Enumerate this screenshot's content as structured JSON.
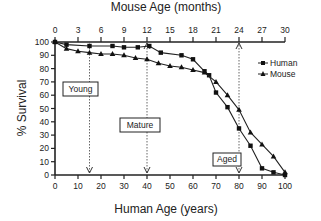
{
  "chart_data": {
    "type": "line",
    "title": "",
    "xlabel": "Human Age (years)",
    "x2label": "Mouse Age (months)",
    "ylabel": "% Survival",
    "xlim": [
      0,
      100
    ],
    "x2lim": [
      0,
      30
    ],
    "ylim": [
      0,
      100
    ],
    "x_ticks": [
      0,
      10,
      20,
      30,
      40,
      50,
      60,
      70,
      80,
      90,
      100
    ],
    "x2_ticks": [
      0,
      3,
      6,
      9,
      12,
      15,
      18,
      21,
      24,
      27,
      30
    ],
    "y_ticks": [
      0,
      10,
      20,
      30,
      40,
      50,
      60,
      70,
      80,
      90,
      100
    ],
    "grid": false,
    "legend_position": "right",
    "series": [
      {
        "name": "Human",
        "marker": "square",
        "x": [
          0,
          5,
          15,
          25,
          30,
          36,
          41,
          46,
          55,
          60,
          65,
          67,
          70,
          75,
          80,
          85,
          90,
          95,
          100
        ],
        "values": [
          100,
          98,
          97,
          97,
          96,
          96,
          97,
          92,
          90,
          87,
          78,
          75,
          62,
          51,
          35,
          22,
          5,
          2,
          0
        ]
      },
      {
        "name": "Mouse",
        "marker": "triangle",
        "x": [
          0,
          5,
          10,
          15,
          20,
          25,
          30,
          35,
          40,
          45,
          50,
          55,
          60,
          65,
          70,
          75,
          80,
          85,
          90,
          95,
          100
        ],
        "values": [
          100,
          95,
          93,
          92,
          91,
          91,
          90,
          88,
          87,
          84,
          82,
          81,
          79,
          77,
          70,
          60,
          49,
          32,
          23,
          14,
          2
        ]
      }
    ],
    "annotations": [
      {
        "label": "Young",
        "x": 15
      },
      {
        "label": "Mature",
        "x": 40
      },
      {
        "label": "Aged",
        "x": 80
      }
    ]
  },
  "labels": {
    "top_axis_title": "Mouse Age (months)",
    "bottom_axis_title": "Human Age (years)",
    "y_axis_title": "% Survival",
    "legend": [
      "Human",
      "Mouse"
    ],
    "boxes": [
      "Young",
      "Mature",
      "Aged"
    ]
  }
}
